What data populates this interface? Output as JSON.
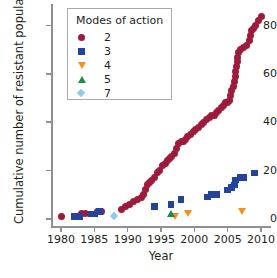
{
  "chart_data": {
    "type": "scatter",
    "title": "",
    "xlabel": "Year",
    "ylabel": "Cumulative number of resistant populations",
    "xlim": [
      1978.5,
      2011.5
    ],
    "ylim": [
      -3,
      89
    ],
    "xticks": [
      1980,
      1985,
      1990,
      1995,
      2000,
      2005,
      2010
    ],
    "yticks": [
      0,
      20,
      40,
      60,
      80
    ],
    "grid": false,
    "legend": {
      "title": "Modes of action",
      "position": "top-left-inside",
      "entries": [
        {
          "label": "2",
          "marker": "circle",
          "color": "#9e1b3c"
        },
        {
          "label": "3",
          "marker": "square",
          "color": "#23439c"
        },
        {
          "label": "4",
          "marker": "triangle-down",
          "color": "#f0901e"
        },
        {
          "label": "5",
          "marker": "triangle-up",
          "color": "#1f8a4c"
        },
        {
          "label": "7",
          "marker": "diamond",
          "color": "#8fcceb"
        }
      ]
    },
    "series": [
      {
        "name": "2",
        "marker": "circle",
        "color": "#9e1b3c",
        "points": [
          [
            1980,
            1
          ],
          [
            1983,
            2
          ],
          [
            1983.6,
            2
          ],
          [
            1985.4,
            3
          ],
          [
            1986,
            3
          ],
          [
            1989,
            4
          ],
          [
            1989.6,
            5
          ],
          [
            1990.2,
            6
          ],
          [
            1990.9,
            7
          ],
          [
            1991.5,
            8
          ],
          [
            1992,
            9
          ],
          [
            1992.4,
            10
          ],
          [
            1992.7,
            12
          ],
          [
            1993,
            14
          ],
          [
            1993.3,
            15
          ],
          [
            1993.6,
            16
          ],
          [
            1994,
            17
          ],
          [
            1994.4,
            19
          ],
          [
            1994.8,
            20
          ],
          [
            1995.2,
            22
          ],
          [
            1995.6,
            23
          ],
          [
            1996,
            24
          ],
          [
            1996.3,
            25
          ],
          [
            1996.6,
            26
          ],
          [
            1997,
            27
          ],
          [
            1997.3,
            29
          ],
          [
            1997.6,
            31
          ],
          [
            1998,
            32
          ],
          [
            1998.3,
            32
          ],
          [
            1998.6,
            33
          ],
          [
            1999,
            34
          ],
          [
            1999.4,
            35
          ],
          [
            1999.8,
            36
          ],
          [
            2000.2,
            37
          ],
          [
            2000.6,
            38
          ],
          [
            2001,
            39
          ],
          [
            2001.4,
            40
          ],
          [
            2001.8,
            41
          ],
          [
            2002.2,
            42
          ],
          [
            2002.6,
            43
          ],
          [
            2003,
            43
          ],
          [
            2003.3,
            44
          ],
          [
            2003.6,
            45
          ],
          [
            2004,
            46
          ],
          [
            2004.3,
            47
          ],
          [
            2004.6,
            48
          ],
          [
            2005,
            48
          ],
          [
            2005.2,
            49
          ],
          [
            2005.4,
            51
          ],
          [
            2005.6,
            53
          ],
          [
            2005.8,
            55
          ],
          [
            2006,
            57
          ],
          [
            2006.1,
            59
          ],
          [
            2006.2,
            61
          ],
          [
            2006.3,
            63
          ],
          [
            2006.4,
            65
          ],
          [
            2006.5,
            67
          ],
          [
            2006.6,
            69
          ],
          [
            2006.9,
            70
          ],
          [
            2007.3,
            71
          ],
          [
            2007.8,
            72
          ],
          [
            2008.2,
            74
          ],
          [
            2008.4,
            76
          ],
          [
            2008.6,
            78
          ],
          [
            2008.8,
            79
          ],
          [
            2009.2,
            80
          ],
          [
            2009.6,
            82
          ],
          [
            2010,
            84
          ]
        ]
      },
      {
        "name": "3",
        "marker": "square",
        "color": "#23439c",
        "points": [
          [
            1982,
            1
          ],
          [
            1982.8,
            1
          ],
          [
            1984.5,
            2
          ],
          [
            1985,
            2
          ],
          [
            1985.8,
            3
          ],
          [
            1994,
            5
          ],
          [
            1996.5,
            6
          ],
          [
            1998,
            8
          ],
          [
            2002,
            9
          ],
          [
            2002.6,
            10
          ],
          [
            2003.4,
            10
          ],
          [
            2005,
            12
          ],
          [
            2005.6,
            13
          ],
          [
            2006,
            14
          ],
          [
            2006.2,
            16
          ],
          [
            2006.9,
            17
          ],
          [
            2007.4,
            17
          ],
          [
            2009,
            19
          ]
        ]
      },
      {
        "name": "4",
        "marker": "triangle-down",
        "color": "#f0901e",
        "points": [
          [
            1997,
            1
          ],
          [
            1999,
            2
          ],
          [
            2007,
            3
          ]
        ]
      },
      {
        "name": "5",
        "marker": "triangle-up",
        "color": "#1f8a4c",
        "points": [
          [
            1996.4,
            2
          ]
        ]
      },
      {
        "name": "7",
        "marker": "diamond",
        "color": "#8fcceb",
        "points": [
          [
            1988,
            1
          ]
        ]
      }
    ]
  }
}
